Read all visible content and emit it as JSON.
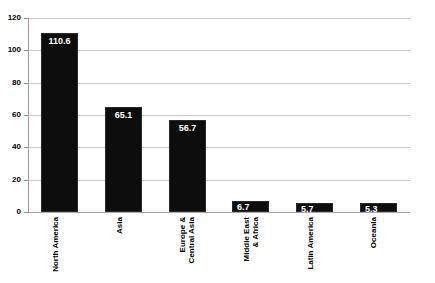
{
  "chart_data": {
    "type": "bar",
    "title": "",
    "subtitle": "",
    "xlabel": "",
    "ylabel": "",
    "ylim": [
      0,
      120
    ],
    "yticks": [
      0,
      20,
      40,
      60,
      80,
      100,
      120
    ],
    "ytick_labels": [
      "0",
      "20",
      "40",
      "60",
      "80",
      "100",
      "120"
    ],
    "grid": true,
    "legend": false,
    "legend_position": "none",
    "orientation": "vertical",
    "bar_color": "#0d0d0d",
    "gridline_color": "#c8c8c8",
    "label_color": "#ffffff",
    "background_color": "#ffffff",
    "categories": [
      "North America",
      "Asia",
      "Europe &\nCentral Asia",
      "Middle East\n& Africa",
      "Latin America",
      "Oceania"
    ],
    "values": [
      110.6,
      65.1,
      56.7,
      6.7,
      5.7,
      5.3
    ],
    "value_labels": [
      "110.6",
      "65.1",
      "56.7",
      "6.7",
      "5.7",
      "5.3"
    ],
    "bars": [
      {
        "category": "North America",
        "value": 110.6,
        "label": "110.6"
      },
      {
        "category": "Asia",
        "value": 65.1,
        "label": "65.1"
      },
      {
        "category": "Europe & Central Asia",
        "value": 56.7,
        "label": "56.7"
      },
      {
        "category": "Middle East & Africa",
        "value": 6.7,
        "label": "6.7"
      },
      {
        "category": "Latin America",
        "value": 5.7,
        "label": "5.7"
      },
      {
        "category": "Oceania",
        "value": 5.3,
        "label": "5.3"
      }
    ]
  }
}
